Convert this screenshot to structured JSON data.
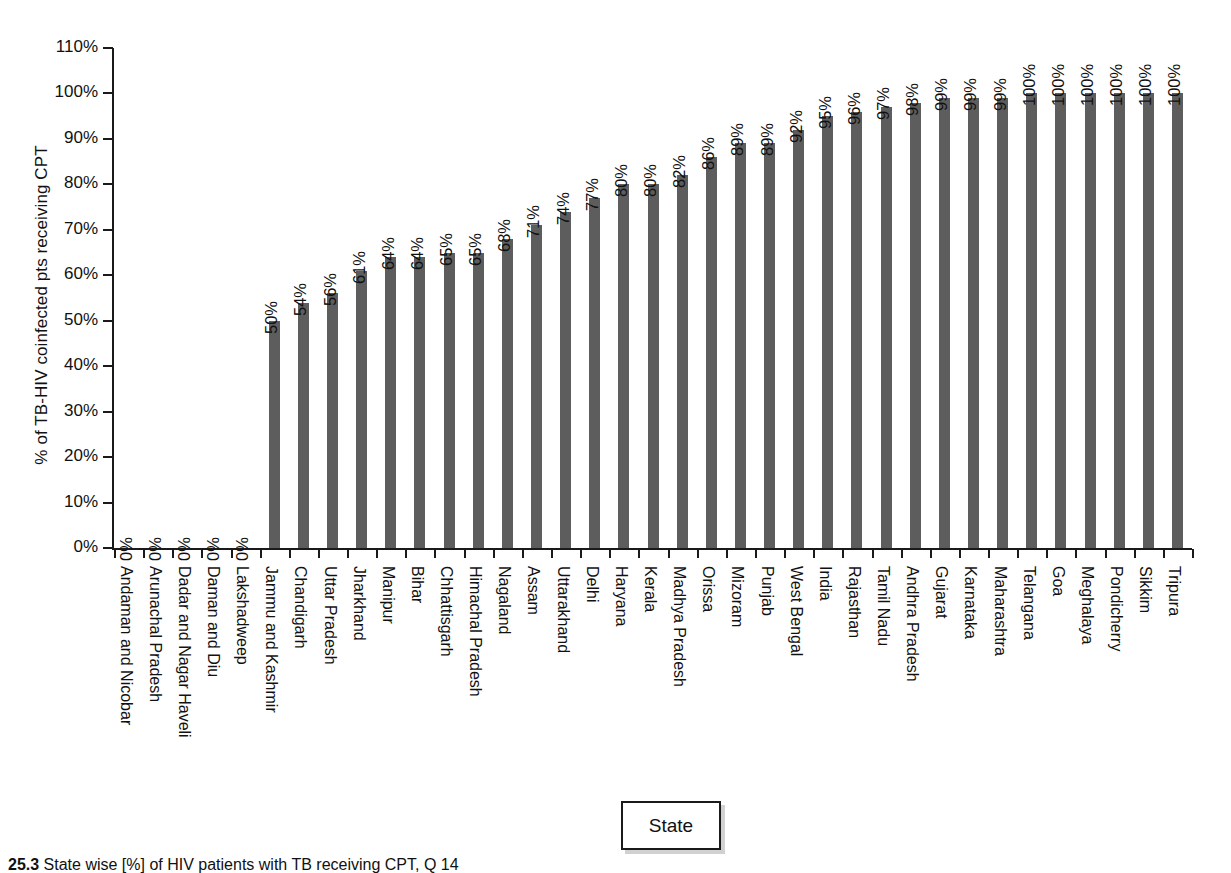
{
  "chart_data": {
    "type": "bar",
    "title": "",
    "xlabel": "State",
    "ylabel": "% of TB-HIV coinfected pts receiving CPT",
    "ylim": [
      0,
      110
    ],
    "ytick_step": 10,
    "grid": false,
    "legend_position": "bottom",
    "bar_color": "#5d5d5d",
    "value_label_suffix": "%",
    "categories": [
      "Andaman and Nicobar",
      "Arunachal Pradesh",
      "Dadar and Nagar Haveli",
      "Daman and Diu",
      "Lakshadweep",
      "Jammu and Kashmir",
      "Chandigarh",
      "Uttar Pradesh",
      "Jharkhand",
      "Manipur",
      "Bihar",
      "Chhattisgarh",
      "Himachal Pradesh",
      "Nagaland",
      "Assam",
      "Uttarakhand",
      "Delhi",
      "Haryana",
      "Kerala",
      "Madhya Pradesh",
      "Orissa",
      "Mizoram",
      "Punjab",
      "West Bengal",
      "India",
      "Rajasthan",
      "Tamil Nadu",
      "Andhra Pradesh",
      "Gujarat",
      "Karnataka",
      "Maharashtra",
      "Telangana",
      "Goa",
      "Meghalaya",
      "Pondicherry",
      "Sikkim",
      "Tripura"
    ],
    "values": [
      0,
      0,
      0,
      0,
      0,
      50,
      54,
      56,
      61,
      64,
      64,
      65,
      65,
      68,
      71,
      74,
      77,
      80,
      80,
      82,
      86,
      89,
      89,
      92,
      95,
      96,
      97,
      98,
      99,
      99,
      99,
      100,
      100,
      100,
      100,
      100,
      100
    ],
    "data_labels": [
      "0%",
      "0%",
      "0%",
      "0%",
      "0%",
      "50%",
      "54%",
      "56%",
      "61%",
      "64%",
      "64%",
      "65%",
      "65%",
      "68%",
      "71%",
      "74%",
      "77%",
      "80%",
      "80%",
      "82%",
      "86%",
      "89%",
      "89%",
      "92%",
      "95%",
      "96%",
      "97%",
      "98%",
      "99%",
      "99%",
      "99%",
      "100%",
      "100%",
      "100%",
      "100%",
      "100%",
      "100%"
    ],
    "ytick_labels": [
      "0%",
      "10%",
      "20%",
      "30%",
      "40%",
      "50%",
      "60%",
      "70%",
      "80%",
      "90%",
      "100%",
      "110%"
    ]
  },
  "legend": {
    "label": "State"
  },
  "caption": {
    "number": "25.3",
    "text": "State wise [%] of HIV patients with TB receiving CPT, Q 14"
  }
}
